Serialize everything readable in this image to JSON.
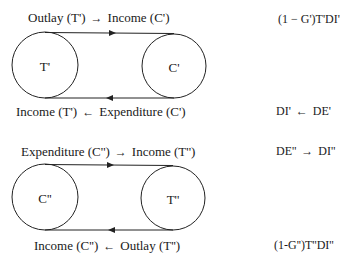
{
  "diagram1": {
    "top_label": {
      "left": "Outlay (T')",
      "arrow": "→",
      "right": "Income (C')"
    },
    "bottom_label": {
      "left": "Income (T')",
      "arrow": "←",
      "right": "Expenditure (C')"
    },
    "left_node": "T'",
    "right_node": "C'",
    "equation_top": "(1 − G')T'DI'",
    "equation_bottom": {
      "left": "DI'",
      "arrow": "←",
      "right": "DE'"
    }
  },
  "diagram2": {
    "top_label": {
      "left": "Expenditure (C'')",
      "arrow": "→",
      "right": "Income (T'')"
    },
    "bottom_label": {
      "left": "Income (C'')",
      "arrow": "←",
      "right": "Outlay (T'')"
    },
    "left_node": "C''",
    "right_node": "T''",
    "equation_top": {
      "left": "DE''",
      "arrow": "→",
      "right": "DI''"
    },
    "equation_bottom": "(1-G'')T''DI''"
  },
  "colors": {
    "stroke": "#222222",
    "text": "#1a1a1a",
    "background": "#ffffff"
  }
}
